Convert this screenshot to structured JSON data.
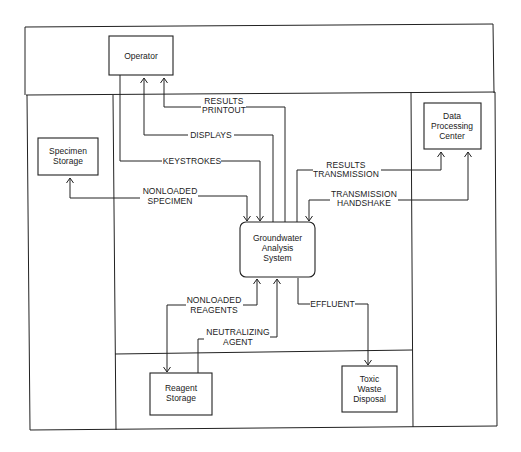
{
  "diagram": {
    "type": "context data flow diagram",
    "entities": {
      "operator": {
        "lines": [
          "Operator"
        ]
      },
      "specimen_storage": {
        "lines": [
          "Specimen",
          "Storage"
        ]
      },
      "data_processing_center": {
        "lines": [
          "Data",
          "Processing",
          "Center"
        ]
      },
      "system": {
        "lines": [
          "Groundwater",
          "Analysis",
          "System"
        ]
      },
      "reagent_storage": {
        "lines": [
          "Reagent",
          "Storage"
        ]
      },
      "toxic_waste_disposal": {
        "lines": [
          "Toxic",
          "Waste",
          "Disposal"
        ]
      }
    },
    "flows": {
      "results_printout": {
        "lines": [
          "RESULTS",
          "PRINTOUT"
        ],
        "from": "Groundwater Analysis System",
        "to": "Operator"
      },
      "displays": {
        "lines": [
          "DISPLAYS"
        ],
        "from": "Groundwater Analysis System",
        "to": "Operator"
      },
      "keystrokes": {
        "lines": [
          "KEYSTROKES"
        ],
        "from": "Operator",
        "to": "Groundwater Analysis System"
      },
      "nonloaded_specimen": {
        "lines": [
          "NONLOADED",
          "SPECIMEN"
        ],
        "from": "Groundwater Analysis System",
        "to": "Specimen Storage"
      },
      "results_transmission": {
        "lines": [
          "RESULTS",
          "TRANSMISSION"
        ],
        "from": "Groundwater Analysis System",
        "to": "Data Processing Center"
      },
      "transmission_handshake": {
        "lines": [
          "TRANSMISSION",
          "HANDSHAKE"
        ],
        "from": "Data Processing Center",
        "to": "Groundwater Analysis System"
      },
      "nonloaded_reagents": {
        "lines": [
          "NONLOADED",
          "REAGENTS"
        ],
        "from": "Groundwater Analysis System",
        "to": "Reagent Storage"
      },
      "neutralizing_agent": {
        "lines": [
          "NEUTRALIZING",
          "AGENT"
        ],
        "from": "Reagent Storage",
        "to": "Groundwater Analysis System"
      },
      "effluent": {
        "lines": [
          "EFFLUENT"
        ],
        "from": "Groundwater Analysis System",
        "to": "Toxic Waste Disposal"
      }
    }
  }
}
